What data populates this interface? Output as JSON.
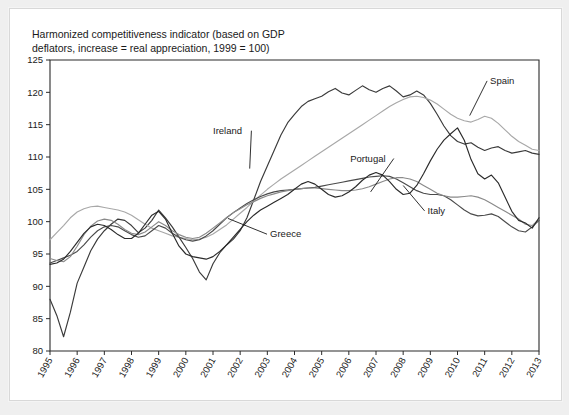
{
  "figure": {
    "title": "Harmonized competitiveness indicator (based on GDP\ndeflators, increase = real appreciation, 1999 = 100)",
    "background_color": "#ffffff",
    "frame_color": "#efefef"
  },
  "chart_data": {
    "type": "line",
    "title": "Harmonized competitiveness indicator (based on GDP deflators, increase = real appreciation, 1999 = 100)",
    "xlabel": "",
    "ylabel": "",
    "xlim": [
      1995,
      2013
    ],
    "ylim": [
      80,
      125
    ],
    "yticks": [
      80,
      85,
      90,
      95,
      100,
      105,
      110,
      115,
      120,
      125
    ],
    "xticks": [
      1995,
      1996,
      1997,
      1998,
      1999,
      2000,
      2001,
      2002,
      2003,
      2004,
      2005,
      2006,
      2007,
      2008,
      2009,
      2010,
      2011,
      2012,
      2013
    ],
    "xtick_labels": [
      "1995",
      "1996",
      "1997",
      "1998",
      "1999",
      "2000",
      "2001",
      "2002",
      "2003",
      "2004",
      "2005",
      "2006",
      "2007",
      "2008",
      "2009",
      "2010",
      "2011",
      "2012",
      "2013"
    ],
    "grid": false,
    "legend": "inline-annotations",
    "x_step": 0.25,
    "series": [
      {
        "name": "Ireland",
        "color": "#3a3a3a",
        "label_x": 2001.0,
        "label_y": 113.6,
        "leader_to_x": 2002.35,
        "leader_to_y": 108.2,
        "values": [
          88.0,
          85.5,
          82.2,
          86.0,
          90.5,
          93.0,
          95.5,
          97.3,
          98.6,
          99.6,
          100.4,
          100.2,
          99.4,
          98.3,
          99.0,
          100.2,
          101.8,
          100.6,
          99.2,
          97.6,
          96.0,
          94.3,
          92.2,
          91.0,
          93.5,
          95.2,
          96.4,
          97.3,
          98.6,
          100.6,
          103.4,
          106.2,
          108.6,
          111.0,
          113.4,
          115.3,
          116.6,
          117.8,
          118.6,
          119.0,
          119.4,
          120.1,
          120.6,
          119.9,
          119.6,
          120.3,
          121.0,
          120.4,
          120.0,
          120.6,
          121.0,
          120.2,
          119.3,
          119.6,
          120.2,
          119.6,
          118.3,
          116.6,
          114.8,
          113.3,
          112.4,
          112.0,
          112.2,
          111.5,
          111.0,
          111.4,
          111.6,
          111.0,
          110.6,
          110.8,
          111.0,
          110.6,
          110.4
        ]
      },
      {
        "name": "Spain",
        "color": "#a8a8a8",
        "label_x": 2011.2,
        "label_y": 121.3,
        "leader_to_x": 2010.45,
        "leader_to_y": 116.4,
        "values": [
          97.2,
          98.3,
          99.4,
          100.6,
          101.5,
          102.0,
          102.3,
          102.4,
          102.2,
          102.0,
          101.8,
          101.5,
          101.0,
          100.3,
          99.6,
          99.0,
          98.6,
          98.2,
          97.8,
          97.6,
          97.4,
          97.2,
          97.3,
          97.6,
          98.1,
          98.8,
          99.5,
          100.4,
          101.3,
          102.2,
          103.2,
          104.1,
          105.0,
          105.8,
          106.6,
          107.3,
          108.0,
          108.7,
          109.4,
          110.1,
          110.8,
          111.5,
          112.2,
          112.9,
          113.6,
          114.3,
          115.0,
          115.7,
          116.4,
          117.1,
          117.8,
          118.4,
          118.9,
          119.3,
          119.4,
          119.2,
          118.8,
          118.2,
          117.4,
          116.6,
          116.0,
          115.6,
          115.4,
          115.8,
          116.3,
          116.0,
          115.2,
          114.2,
          113.2,
          112.4,
          111.8,
          111.2,
          111.0
        ]
      },
      {
        "name": "Portugal",
        "color": "#4a4a4a",
        "label_x": 2006.05,
        "label_y": 109.3,
        "leader_to_x": 2006.8,
        "leader_to_y": 104.6,
        "values": [
          93.6,
          94.0,
          94.4,
          94.8,
          95.4,
          96.4,
          97.6,
          98.6,
          99.2,
          99.4,
          99.2,
          98.6,
          98.0,
          97.6,
          97.8,
          98.6,
          99.4,
          99.0,
          98.2,
          97.6,
          97.2,
          97.0,
          97.2,
          97.8,
          98.6,
          99.6,
          100.6,
          101.4,
          102.1,
          102.8,
          103.4,
          103.9,
          104.3,
          104.6,
          104.8,
          104.9,
          105.0,
          105.1,
          105.2,
          105.3,
          105.5,
          105.7,
          105.9,
          106.1,
          106.3,
          106.5,
          106.7,
          106.9,
          107.0,
          107.1,
          107.0,
          106.6,
          106.0,
          105.4,
          104.8,
          104.4,
          104.2,
          104.2,
          104.0,
          103.4,
          102.6,
          101.8,
          101.2,
          100.9,
          101.0,
          101.2,
          100.8,
          100.0,
          99.2,
          98.6,
          98.4,
          99.2,
          100.2
        ]
      },
      {
        "name": "Italy",
        "color": "#8a8a8a",
        "label_x": 2008.9,
        "label_y": 101.2,
        "leader_to_x": 2008.0,
        "leader_to_y": 105.6,
        "values": [
          94.3,
          94.0,
          93.8,
          94.6,
          96.2,
          98.0,
          99.3,
          100.1,
          100.4,
          100.2,
          99.6,
          98.8,
          98.2,
          98.0,
          98.4,
          99.2,
          100.0,
          99.4,
          98.6,
          98.0,
          97.6,
          97.4,
          97.6,
          98.2,
          99.0,
          99.8,
          100.6,
          101.4,
          102.0,
          102.6,
          103.1,
          103.6,
          104.0,
          104.3,
          104.6,
          104.8,
          105.0,
          105.1,
          105.2,
          105.2,
          105.1,
          105.0,
          104.9,
          104.8,
          104.8,
          104.9,
          105.1,
          105.4,
          105.8,
          106.2,
          106.6,
          106.8,
          106.8,
          106.6,
          106.2,
          105.6,
          105.0,
          104.4,
          104.0,
          103.8,
          103.8,
          103.9,
          104.0,
          103.8,
          103.4,
          102.8,
          102.2,
          101.6,
          101.0,
          100.4,
          99.6,
          99.4,
          100.4
        ]
      },
      {
        "name": "Greece",
        "color": "#2b2b2b",
        "label_x": 2003.1,
        "label_y": 97.6,
        "leader_to_x": 2001.55,
        "leader_to_y": 100.5,
        "values": [
          93.4,
          93.6,
          94.2,
          95.4,
          96.8,
          98.2,
          99.2,
          99.6,
          99.4,
          98.8,
          98.0,
          97.4,
          97.4,
          98.2,
          99.6,
          101.0,
          101.6,
          100.4,
          98.2,
          96.2,
          95.0,
          94.6,
          94.4,
          94.2,
          94.6,
          95.4,
          96.4,
          97.6,
          98.8,
          100.0,
          101.0,
          101.8,
          102.4,
          103.0,
          103.6,
          104.2,
          105.0,
          105.8,
          106.2,
          105.8,
          105.0,
          104.2,
          103.8,
          104.0,
          104.6,
          105.4,
          106.4,
          107.2,
          107.6,
          107.2,
          106.2,
          105.0,
          104.2,
          104.4,
          105.6,
          107.4,
          109.4,
          111.2,
          112.6,
          113.6,
          114.5,
          112.6,
          109.6,
          107.4,
          106.6,
          107.2,
          106.0,
          103.8,
          101.6,
          100.2,
          99.8,
          99.0,
          100.6
        ]
      }
    ]
  }
}
